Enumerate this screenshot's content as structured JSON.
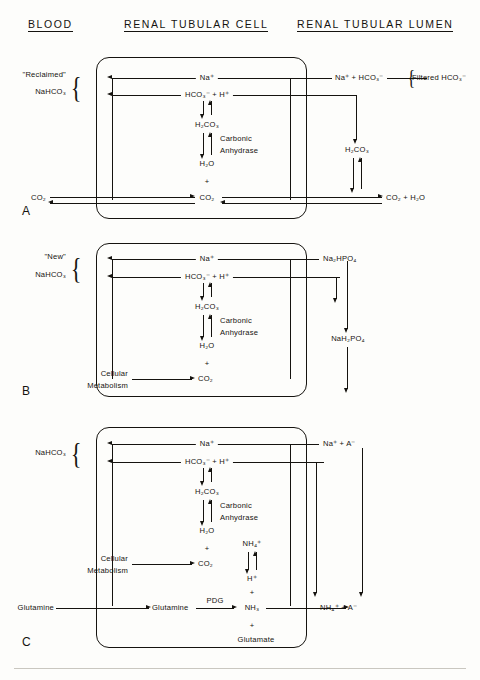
{
  "headers": {
    "blood": "BLOOD",
    "cell": "RENAL TUBULAR CELL",
    "lumen": "RENAL TUBULAR LUMEN"
  },
  "common": {
    "na": "Na⁺",
    "hco3_h": "HCO₃⁻ + H⁺",
    "h2co3": "H₂CO₃",
    "h2o": "H₂O",
    "plus": "+",
    "co2": "CO₂",
    "carbonic": "Carbonic",
    "anhydrase": "Anhydrase",
    "cellular": "Cellular",
    "metabolism": "Metabolism",
    "nahco3": "NaHCO₃"
  },
  "panels": [
    {
      "letter": "A",
      "blood_label_top": "\"Reclaimed\"",
      "blood_label_bottom": "NaHCO₃",
      "lumen_top": "Na⁺ + HCO₃⁻",
      "lumen_brace_label": "Filtered HCO₃⁻",
      "lumen_mid": "H₂CO₃",
      "lumen_bottom": "CO₂ + H₂O",
      "blood_bottom_left": "CO₂",
      "cell_bottom": "CO₂",
      "enzyme_line1": "Carbonic",
      "enzyme_line2": "Anhydrase"
    },
    {
      "letter": "B",
      "blood_label_top": "\"New\"",
      "blood_label_bottom": "NaHCO₃",
      "lumen_top": "Na₂HPO₄",
      "lumen_mid": "NaH₂PO₄",
      "source_line1": "Cellular",
      "source_line2": "Metabolism",
      "source_product": "CO₂",
      "enzyme_line1": "Carbonic",
      "enzyme_line2": "Anhydrase"
    },
    {
      "letter": "C",
      "blood_label": "NaHCO₃",
      "lumen_top": "Na⁺ + A⁻",
      "lumen_bottom": "NH₄⁺ + A⁻",
      "source_line1": "Cellular",
      "source_line2": "Metabolism",
      "source_product": "CO₂",
      "nh4": "NH₄⁺",
      "h_plus": "H⁺",
      "nh3": "NH₃",
      "glutamine_blood": "Glutamine",
      "glutamine_cell": "Glutamine",
      "enzyme_pdg": "PDG",
      "glutamate": "Glutamate",
      "enzyme_line1": "Carbonic",
      "enzyme_line2": "Anhydrase"
    }
  ]
}
